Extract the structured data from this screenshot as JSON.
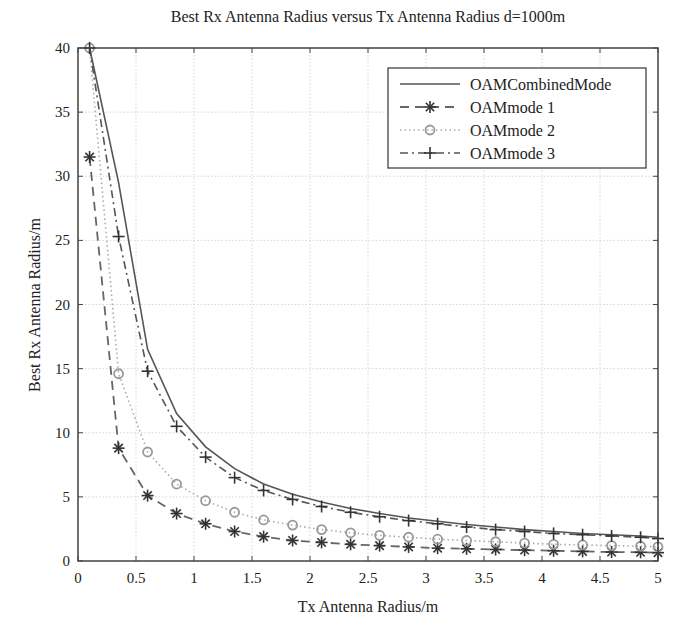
{
  "chart_data": {
    "type": "line",
    "title": "Best Rx Antenna Radius versus Tx Antenna Radius d=1000m",
    "xlabel": "Tx Antenna Radius/m",
    "ylabel": "Best Rx Antenna Radius/m",
    "xlim": [
      0,
      5
    ],
    "ylim": [
      0,
      40
    ],
    "xticks": [
      "0",
      "0.5",
      "1",
      "1.5",
      "2",
      "2.5",
      "3",
      "3.5",
      "4",
      "4.5",
      "5"
    ],
    "yticks": [
      "0",
      "5",
      "10",
      "15",
      "20",
      "25",
      "30",
      "35",
      "40"
    ],
    "grid": true,
    "legend_position": "upper right",
    "x": [
      0.1,
      0.35,
      0.6,
      0.85,
      1.1,
      1.35,
      1.6,
      1.85,
      2.1,
      2.35,
      2.6,
      2.85,
      3.1,
      3.35,
      3.6,
      3.85,
      4.1,
      4.35,
      4.6,
      4.85,
      5.0
    ],
    "series": [
      {
        "name": "OAMCombinedMode",
        "style": "solid",
        "marker": "none",
        "values": [
          40,
          29.5,
          16.5,
          11.5,
          8.9,
          7.2,
          6.0,
          5.2,
          4.6,
          4.1,
          3.7,
          3.35,
          3.1,
          2.85,
          2.65,
          2.45,
          2.3,
          2.15,
          2.05,
          1.95,
          1.85
        ]
      },
      {
        "name": "OAMmode 1",
        "style": "dashed",
        "marker": "asterisk",
        "values": [
          31.5,
          8.8,
          5.1,
          3.7,
          2.9,
          2.3,
          1.9,
          1.6,
          1.45,
          1.3,
          1.2,
          1.1,
          1.0,
          0.95,
          0.9,
          0.85,
          0.8,
          0.75,
          0.7,
          0.68,
          0.65
        ]
      },
      {
        "name": "OAMmode 2",
        "style": "dotted",
        "marker": "circle",
        "values": [
          40,
          14.6,
          8.5,
          6.0,
          4.7,
          3.8,
          3.2,
          2.8,
          2.45,
          2.2,
          2.0,
          1.85,
          1.7,
          1.6,
          1.5,
          1.4,
          1.3,
          1.25,
          1.2,
          1.15,
          1.1
        ]
      },
      {
        "name": "OAMmode 3",
        "style": "dashdot",
        "marker": "plus",
        "values": [
          40,
          25.3,
          14.8,
          10.5,
          8.1,
          6.5,
          5.5,
          4.8,
          4.25,
          3.8,
          3.45,
          3.15,
          2.9,
          2.65,
          2.45,
          2.3,
          2.15,
          2.05,
          1.95,
          1.85,
          1.75
        ]
      }
    ]
  }
}
